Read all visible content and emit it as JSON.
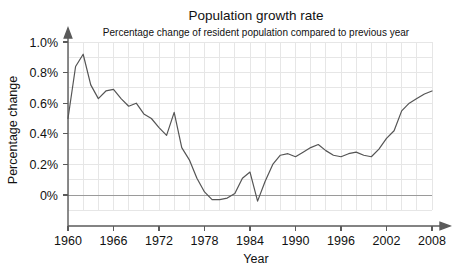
{
  "chart_data": {
    "type": "line",
    "title": "Population growth rate",
    "subtitle": "Percentage change of resident population compared to previous year",
    "xlabel": "Year",
    "ylabel": "Percentage change",
    "xlim": [
      1960,
      2008
    ],
    "ylim": [
      -0.1,
      1.05
    ],
    "grid": true,
    "legend": "none",
    "ytick_labels": [
      "1.0%",
      "0.8%",
      "0.6%",
      "0.4%",
      "0.2%",
      "0%"
    ],
    "ytick_values": [
      1.0,
      0.8,
      0.6,
      0.4,
      0.2,
      0.0
    ],
    "xtick_labels": [
      "1960",
      "1966",
      "1972",
      "1978",
      "1984",
      "1990",
      "1996",
      "2002",
      "2008"
    ],
    "xtick_values": [
      1960,
      1966,
      1972,
      1978,
      1984,
      1990,
      1996,
      2002,
      2008
    ],
    "x_gridline_step": 2,
    "units": "percent",
    "x": [
      1960,
      1961,
      1962,
      1963,
      1964,
      1965,
      1966,
      1967,
      1968,
      1969,
      1970,
      1971,
      1972,
      1973,
      1974,
      1975,
      1976,
      1977,
      1978,
      1979,
      1980,
      1981,
      1982,
      1983,
      1984,
      1985,
      1986,
      1987,
      1988,
      1989,
      1990,
      1991,
      1992,
      1993,
      1994,
      1995,
      1996,
      1997,
      1998,
      1999,
      2000,
      2001,
      2002,
      2003,
      2004,
      2005,
      2006,
      2007,
      2008
    ],
    "values": [
      0.5,
      0.84,
      0.92,
      0.72,
      0.63,
      0.68,
      0.69,
      0.63,
      0.58,
      0.6,
      0.53,
      0.5,
      0.44,
      0.39,
      0.54,
      0.31,
      0.23,
      0.11,
      0.02,
      -0.03,
      -0.03,
      -0.02,
      0.01,
      0.11,
      0.15,
      -0.04,
      0.09,
      0.2,
      0.26,
      0.27,
      0.25,
      0.28,
      0.31,
      0.33,
      0.29,
      0.26,
      0.25,
      0.27,
      0.28,
      0.26,
      0.25,
      0.3,
      0.37,
      0.42,
      0.55,
      0.6,
      0.63,
      0.66,
      0.68
    ],
    "series_name": "Percentage change of resident population",
    "colors": {
      "line": "#555555",
      "grid": "#e6e6e6",
      "zero_line": "#9a9a9a",
      "axis": "#5a5a5a",
      "background": "#ffffff",
      "text": "#111111"
    }
  }
}
